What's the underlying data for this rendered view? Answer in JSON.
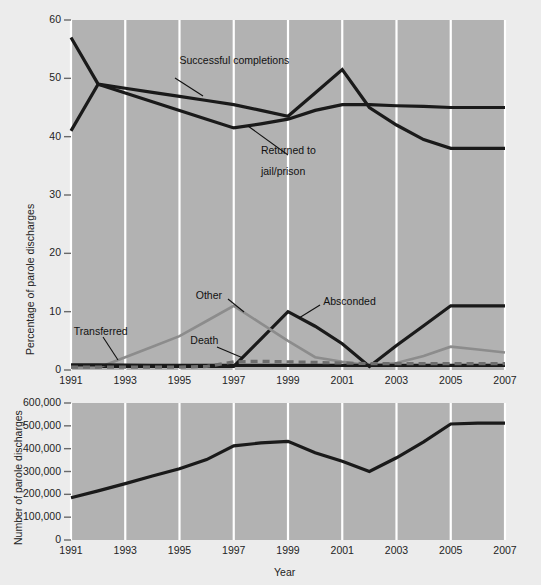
{
  "figure": {
    "background_color": "#ececec",
    "plot_background_color": "#b2b2b2",
    "gridline_color": "#ffffff",
    "dark_line_color": "#1a1a1a",
    "gray_line_color": "#8c8c8c",
    "dashed_line_color": "#6e6e6e"
  },
  "chart_data": [
    {
      "type": "line",
      "id": "percentage-of-parole-discharges",
      "title": "",
      "xlabel": "",
      "ylabel": "Percentage of parole discharges",
      "x": [
        1991,
        1992,
        1993,
        1994,
        1995,
        1996,
        1997,
        1998,
        1999,
        2000,
        2001,
        2002,
        2003,
        2004,
        2005,
        2006,
        2007
      ],
      "xlim": [
        1991,
        2007
      ],
      "ylim": [
        0,
        60
      ],
      "yticks": [
        0,
        10,
        20,
        30,
        40,
        50,
        60
      ],
      "ytick_labels": [
        "0",
        "10",
        "20",
        "30",
        "40",
        "50",
        "60"
      ],
      "xticks": [
        1991,
        1993,
        1995,
        1997,
        1999,
        2001,
        2003,
        2005,
        2007
      ],
      "xtick_labels": [
        "1991",
        "1993",
        "1995",
        "1997",
        "1999",
        "2001",
        "2003",
        "2005",
        "2007"
      ],
      "grid": "vertical",
      "legend": "inline-annotations",
      "series": [
        {
          "name": "Returned to jail/prison",
          "color": "#1a1a1a",
          "style": "solid",
          "values": [
            57,
            49,
            48.3,
            47.6,
            46.9,
            46.2,
            45.5,
            44.5,
            43.5,
            47.5,
            51.5,
            45,
            42,
            39.5,
            38,
            38,
            38
          ]
        },
        {
          "name": "Successful completions",
          "color": "#1a1a1a",
          "style": "solid",
          "values": [
            41,
            49,
            47.5,
            46,
            44.5,
            43,
            41.5,
            42.2,
            43,
            44.5,
            45.5,
            45.5,
            45.3,
            45.2,
            45,
            45,
            45
          ]
        },
        {
          "name": "Absconded",
          "color": "#1a1a1a",
          "style": "solid",
          "values": [
            0.6,
            0.6,
            0.6,
            0.6,
            0.6,
            0.6,
            0.6,
            5.3,
            10,
            7.5,
            4.5,
            0.6,
            4.2,
            7.6,
            11,
            11,
            11
          ]
        },
        {
          "name": "Other",
          "color": "#8c8c8c",
          "style": "solid",
          "values": [
            0.4,
            0.4,
            2.2,
            4.0,
            5.8,
            8.4,
            11,
            8.0,
            5.0,
            2.2,
            1.4,
            0.8,
            1.2,
            2.4,
            4.0,
            3.5,
            3.0
          ]
        },
        {
          "name": "Transferred",
          "color": "#1a1a1a",
          "style": "solid",
          "values": [
            0.9,
            0.9,
            0.85,
            0.8,
            0.8,
            0.8,
            0.8,
            0.8,
            0.8,
            0.8,
            0.8,
            0.8,
            0.8,
            0.8,
            0.8,
            0.8,
            0.8
          ]
        },
        {
          "name": "Death",
          "color": "#6e6e6e",
          "style": "dashed",
          "values": [
            0.5,
            0.5,
            0.5,
            0.5,
            0.5,
            0.6,
            1.4,
            1.5,
            1.4,
            1.3,
            1.2,
            1.1,
            1.1,
            1.1,
            1.1,
            1.1,
            1.1
          ]
        }
      ],
      "annotations": [
        {
          "text": "Successful completions",
          "x": 1995.0,
          "y": 53.0
        },
        {
          "text": "Returned to",
          "x": 1998.0,
          "y": 37.6
        },
        {
          "text": "jail/prison",
          "x": 1998.0,
          "y": 34.0
        },
        {
          "text": "Other",
          "x": 1995.6,
          "y": 12.7
        },
        {
          "text": "Absconded",
          "x": 2000.3,
          "y": 11.6
        },
        {
          "text": "Transferred",
          "x": 1991.1,
          "y": 6.5
        },
        {
          "text": "Death",
          "x": 1995.4,
          "y": 5.0
        }
      ]
    },
    {
      "type": "line",
      "id": "number-of-parole-discharges",
      "title": "",
      "xlabel": "Year",
      "ylabel": "Number of parole discharges",
      "x": [
        1991,
        1992,
        1993,
        1994,
        1995,
        1996,
        1997,
        1998,
        1999,
        2000,
        2001,
        2002,
        2003,
        2004,
        2005,
        2006,
        2007
      ],
      "xlim": [
        1991,
        2007
      ],
      "ylim": [
        0,
        600000
      ],
      "yticks": [
        0,
        100000,
        200000,
        300000,
        400000,
        500000,
        600000
      ],
      "ytick_labels": [
        "0",
        "100,000",
        "200,000",
        "300,000",
        "400,000",
        "500,000",
        "600,000"
      ],
      "xticks": [
        1991,
        1993,
        1995,
        1997,
        1999,
        2001,
        2003,
        2005,
        2007
      ],
      "xtick_labels": [
        "1991",
        "1993",
        "1995",
        "1997",
        "1999",
        "2001",
        "2003",
        "2005",
        "2007"
      ],
      "grid": "vertical",
      "series": [
        {
          "name": "Number of parole discharges",
          "color": "#1a1a1a",
          "style": "solid",
          "values": [
            185000,
            215000,
            247000,
            280000,
            312000,
            352000,
            412000,
            425000,
            432000,
            382000,
            345000,
            300000,
            360000,
            430000,
            508000,
            512000,
            512000
          ]
        }
      ]
    }
  ]
}
